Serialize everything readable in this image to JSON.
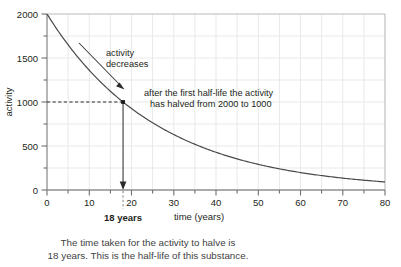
{
  "chart_data": {
    "type": "line",
    "title": "",
    "xlabel": "time (years)",
    "ylabel": "activity",
    "xlim": [
      0,
      80
    ],
    "ylim": [
      0,
      2000
    ],
    "grid": true,
    "legend": "none",
    "x_ticks": [
      0,
      10,
      20,
      30,
      40,
      50,
      60,
      70,
      80
    ],
    "x_tick_labels": [
      "0",
      "10",
      "20",
      "30",
      "40",
      "50",
      "60",
      "70",
      "80"
    ],
    "x_minor_ticks": [
      5,
      15,
      25,
      35,
      45,
      55,
      65,
      75
    ],
    "y_ticks": [
      0,
      500,
      1000,
      1500,
      2000
    ],
    "y_tick_labels": [
      "0",
      "500",
      "1000",
      "1500",
      "2000"
    ],
    "y_minor_ticks": [
      250,
      750,
      1250,
      1750
    ],
    "curve": {
      "name": "activity decay",
      "equation": "A = 2000 * 0.5^(t/18)",
      "initial_activity": 2000,
      "half_life_years": 18,
      "x": [
        0,
        5,
        10,
        15,
        18,
        20,
        25,
        30,
        35,
        36,
        40,
        45,
        50,
        54,
        55,
        60,
        65,
        70,
        72,
        75,
        80
      ],
      "y": [
        2000,
        1677,
        1407,
        1180,
        1000,
        1000,
        832,
        698,
        585,
        500,
        491,
        412,
        345,
        250,
        290,
        243,
        204,
        171,
        125,
        143,
        121
      ]
    },
    "annotations": [
      {
        "name": "activity-decreases",
        "lines": [
          "activity",
          "decreases"
        ],
        "x": 18,
        "y": 1530
      },
      {
        "name": "half-life-note",
        "lines": [
          "after the first half-life the activity",
          "has halved from 2000 to 1000"
        ],
        "x": 21,
        "y": 1060
      }
    ],
    "markers": [
      {
        "name": "half-life-point",
        "x": 18,
        "y": 1000,
        "x_label": "18 years",
        "y_label": "1000"
      }
    ]
  },
  "axes": {
    "y_axis_title": "activity",
    "x_axis_title": "time (years)"
  },
  "marker": {
    "bold_label": "18 years"
  },
  "annotations": {
    "decrease_line1": "activity",
    "decrease_line2": "decreases",
    "halflife_line1": "after the first half-life the activity",
    "halflife_line2": "has halved from 2000 to 1000"
  },
  "caption": {
    "line1": "The time taken for the activity to halve is",
    "line2": "18 years. This is the half-life of this substance."
  },
  "colors": {
    "background": "#ffffff",
    "curve": "#4a4a4a",
    "axis": "#8a8a8a",
    "grid": "#e8e8ea",
    "text": "#231f20",
    "caption_text": "#3f3f42",
    "frame": "#b9b9bc"
  }
}
